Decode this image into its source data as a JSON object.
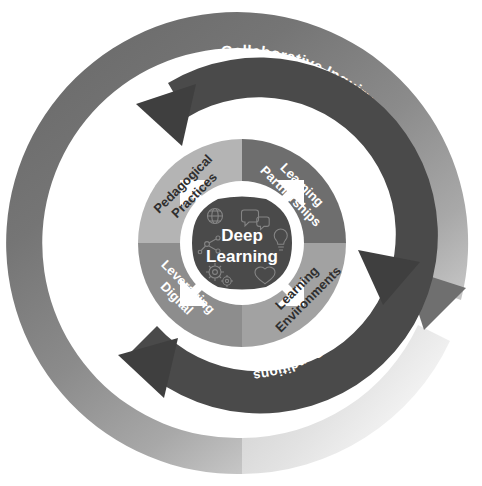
{
  "diagram": {
    "center": {
      "line1": "Deep",
      "line2": "Learning",
      "icons": [
        "globe-icon",
        "speech-bubbles-icon",
        "lightbulb-icon",
        "heart-icon",
        "gears-icon",
        "molecule-icon"
      ]
    },
    "quadrants": [
      {
        "id": "pedagogical-practices",
        "line1": "Pedagogical",
        "line2": "Practices",
        "position": "top-left",
        "fill": "#b4b4b4",
        "text_color": "#2f2f2f"
      },
      {
        "id": "learning-partnerships",
        "line1": "Learning",
        "line2": "Partnerships",
        "position": "top-right",
        "fill": "#6e6e6e",
        "text_color": "#ffffff"
      },
      {
        "id": "leveraging-digital",
        "line1": "Leveraging",
        "line2": "Digital",
        "position": "bottom-left",
        "fill": "#8d8d8d",
        "text_color": "#ffffff"
      },
      {
        "id": "learning-environments",
        "line1": "Learning",
        "line2": "Environments",
        "position": "bottom-right",
        "fill": "#a2a2a2",
        "text_color": "#2f2f2f"
      }
    ],
    "inner_ring": {
      "id": "conditions-ring",
      "fill": "#4a4a4a",
      "text_color": "#ffffff",
      "labels": [
        {
          "id": "school-conditions",
          "text": "School Conditions"
        },
        {
          "id": "district-conditions",
          "text": "District Conditions"
        },
        {
          "id": "system-conditions",
          "text": "System Conditions"
        }
      ]
    },
    "outer_ring": {
      "id": "collaborative-inquiry-ring",
      "fill_start": "#6d6d6d",
      "fill_end": "#ededed",
      "text_color": "#ffffff",
      "labels": [
        {
          "id": "collaborative-inquiry",
          "text": "Collaborative Inquiry"
        }
      ]
    },
    "colors": {
      "background": "#ffffff",
      "dark_ring": "#4a4a4a",
      "center_disc": "#4a4a4a",
      "center_halo": "#ffffff",
      "arrow_white": "#ffffff"
    }
  }
}
